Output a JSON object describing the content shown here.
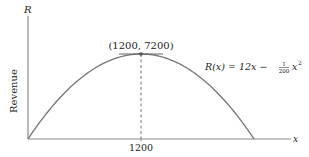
{
  "chart_data": {
    "type": "line",
    "title": "",
    "xlabel": "x",
    "ylabel": "R",
    "ylabel_side": "Revenue",
    "function": "R(x) = 12x - (1/200) x^2",
    "equation_label": {
      "lhs": "R(x) = 12x −",
      "frac_num": "1",
      "frac_den": "200",
      "rhs": "x",
      "exp": "2"
    },
    "x": [
      0,
      200,
      400,
      600,
      800,
      1000,
      1200,
      1400,
      1600,
      1800,
      2000,
      2200,
      2400
    ],
    "values": [
      0,
      2200,
      4000,
      5400,
      6400,
      7000,
      7200,
      7000,
      6400,
      5400,
      4000,
      2200,
      0
    ],
    "xlim": [
      0,
      2800
    ],
    "ylim": [
      0,
      8300
    ],
    "x_ticks": [
      "1200"
    ],
    "annotations": [
      {
        "text": "(1200, 7200)",
        "x": 1200,
        "y": 7200,
        "marker": "dot",
        "tangent_line": true
      },
      {
        "type": "dashed_vline",
        "x": 1200
      }
    ],
    "grid": false,
    "legend": "none"
  },
  "colors": {
    "curve": "#7a7a7a",
    "axis": "#8a8a8a",
    "text": "#222222",
    "dashed": "#666666"
  }
}
